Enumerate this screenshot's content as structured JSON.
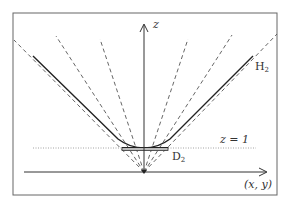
{
  "diagram": {
    "labels": {
      "z_axis": "z",
      "horizontal_axis": "(x, y)",
      "hyperboloid": "H",
      "hyperboloid_sub": "2",
      "disk": "D",
      "disk_sub": "2",
      "plane": "z = 1"
    },
    "colors": {
      "stroke": "#333333",
      "dashed": "#555555",
      "dotted": "#888888",
      "frame": "#666666",
      "background": "#ffffff"
    },
    "geometry": {
      "frame": [
        13,
        13,
        264,
        182
      ],
      "origin": [
        144,
        172
      ],
      "z1_level_y": 148,
      "disk_x_range": [
        122,
        168
      ],
      "dashed_ray_tops": [
        [
          14,
          40
        ],
        [
          56,
          36
        ],
        [
          100,
          39
        ],
        [
          188,
          39
        ],
        [
          232,
          35
        ],
        [
          277,
          34
        ]
      ]
    }
  }
}
